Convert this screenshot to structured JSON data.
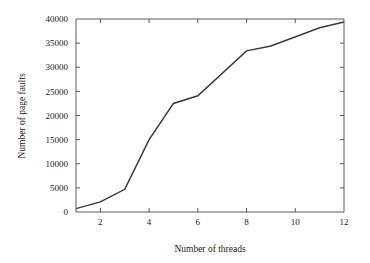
{
  "chart_data": {
    "type": "line",
    "title": "",
    "subtitle": "",
    "xlabel": "Number of threads",
    "ylabel": "Number of page faults",
    "xlim": [
      1,
      12
    ],
    "ylim": [
      0,
      40000
    ],
    "grid": false,
    "legend": null,
    "legend_position": "none",
    "line_color": "#3a3a3a",
    "axis_color": "#4a4a4a",
    "background": "#ffffff",
    "x": [
      1,
      2,
      3,
      4,
      5,
      6,
      8,
      9,
      11,
      12
    ],
    "values": [
      700,
      2100,
      4700,
      15000,
      22500,
      24100,
      33400,
      34400,
      38200,
      39400
    ],
    "series": [
      {
        "name": "Page faults",
        "x": [
          1,
          2,
          3,
          4,
          5,
          6,
          8,
          9,
          11,
          12
        ],
        "values": [
          700,
          2100,
          4700,
          15000,
          22500,
          24100,
          33400,
          34400,
          38200,
          39400
        ]
      }
    ],
    "xticks": [
      2,
      4,
      6,
      8,
      10,
      12
    ],
    "xtick_labels": [
      "2",
      "4",
      "6",
      "8",
      "10",
      "12"
    ],
    "yticks": [
      0,
      5000,
      10000,
      15000,
      20000,
      25000,
      30000,
      35000,
      40000
    ],
    "ytick_labels": [
      "0",
      "5000",
      "10000",
      "15000",
      "20000",
      "25000",
      "30000",
      "35000",
      "40000"
    ],
    "annotations": []
  }
}
